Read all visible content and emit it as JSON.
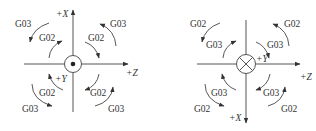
{
  "diagrams": [
    {
      "id": "left",
      "center_symbol": "dot-in-circle",
      "center_meaning": "+Y axis pointing out of page",
      "axes": {
        "vertical_label": "+X",
        "vertical_direction": "up",
        "horizontal_label": "+Z",
        "horizontal_direction": "right",
        "normal_label": "+Y"
      },
      "quadrants": {
        "top_left": {
          "outer": "G03",
          "inner": "G02"
        },
        "top_right": {
          "outer": "G03",
          "inner": "G02"
        },
        "bottom_left": {
          "outer": "G03",
          "inner": "G02"
        },
        "bottom_right": {
          "outer": "G03",
          "inner": "G02"
        }
      }
    },
    {
      "id": "right",
      "center_symbol": "x-in-circle",
      "center_meaning": "+Y axis pointing into page",
      "axes": {
        "vertical_label": "+X",
        "vertical_direction": "down",
        "horizontal_label": "+Z",
        "horizontal_direction": "right",
        "normal_label": "+Y"
      },
      "quadrants": {
        "top_left": {
          "outer": "G02",
          "inner": "G03"
        },
        "top_right": {
          "outer": "G02",
          "inner": "G03"
        },
        "bottom_left": {
          "outer": "G02",
          "inner": "G03"
        },
        "bottom_right": {
          "outer": "G02",
          "inner": "G03"
        }
      }
    }
  ],
  "colors": {
    "line": "#555555",
    "text": "#333333",
    "background": "#ffffff"
  }
}
